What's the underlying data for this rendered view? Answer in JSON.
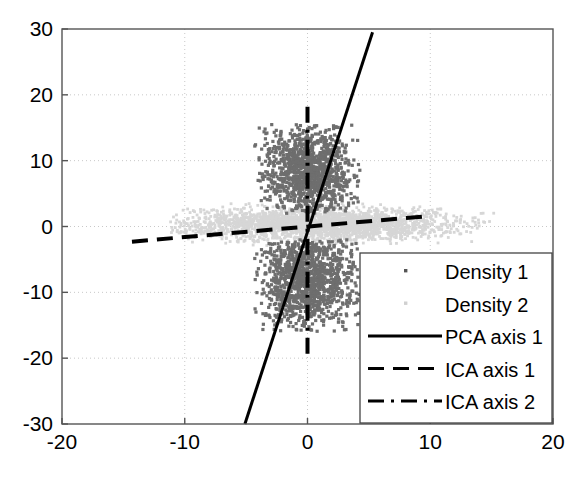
{
  "chart_data": {
    "type": "scatter",
    "title": "",
    "xlabel": "",
    "ylabel": "",
    "xlim": [
      -20,
      20
    ],
    "ylim": [
      -30,
      30
    ],
    "xticks": [
      -20,
      -10,
      0,
      10,
      20
    ],
    "yticks": [
      -30,
      -20,
      -10,
      0,
      10,
      20,
      30
    ],
    "xtick_labels": [
      "-20",
      "-10",
      "0",
      "10",
      "20"
    ],
    "ytick_labels": [
      "-30",
      "-20",
      "-10",
      "0",
      "10",
      "20",
      "30"
    ],
    "grid": true,
    "grid_style": "dotted",
    "grid_color": "#c8c8c8",
    "axes_color": "#555555",
    "background": "#ffffff",
    "legend_position": "lower right",
    "series": [
      {
        "name": "Density 1",
        "type": "scatter",
        "marker": "dot",
        "color": "#6e6e6e",
        "description": "Dense vertically-elongated bimodal point cloud centred at x=0, two lobes above and below y=0",
        "n_points": 2600,
        "x_center": 0,
        "y_center": 0,
        "x_spread": 1.9,
        "y_spread": 6.0,
        "x_range": [
          -4.3,
          4.3
        ],
        "y_range": [
          -16.0,
          15.5
        ],
        "bimodal_gap": [
          -2.0,
          2.0
        ],
        "lobe_centers_y": [
          8.0,
          -8.0
        ]
      },
      {
        "name": "Density 2",
        "type": "scatter",
        "marker": "dot",
        "color": "#d6d6d6",
        "description": "Sparse horizontally-elongated band centred at x=0 y=0.5 extending far left and right",
        "n_points": 2600,
        "x_center": 0.8,
        "y_center": 0.4,
        "x_spread": 5.2,
        "y_spread": 1.2,
        "x_range": [
          -11.5,
          15.5
        ],
        "y_range": [
          -3.0,
          3.5
        ]
      },
      {
        "name": "PCA axis 1",
        "type": "line",
        "style": "solid",
        "color": "#000000",
        "width": 3,
        "points": [
          [
            -5.1,
            -30.0
          ],
          [
            5.3,
            29.5
          ]
        ],
        "slope": 5.72,
        "intercept": 0.0
      },
      {
        "name": "ICA axis 1",
        "type": "line",
        "style": "dashed",
        "color": "#000000",
        "width": 4,
        "points": [
          [
            -14.3,
            -2.3
          ],
          [
            10.0,
            1.6
          ]
        ],
        "slope": 0.16,
        "intercept": 0.0
      },
      {
        "name": "ICA axis 2",
        "type": "line",
        "style": "dashdot",
        "color": "#000000",
        "width": 4,
        "points": [
          [
            0.0,
            18.2
          ],
          [
            0.0,
            -20.0
          ]
        ],
        "slope": null,
        "intercept": 0.0
      }
    ],
    "legend_entries": [
      {
        "label": "Density 1",
        "kind": "marker",
        "style": "dot",
        "color": "#555555"
      },
      {
        "label": "Density 2",
        "kind": "marker",
        "style": "dot",
        "color": "#d0d0d0"
      },
      {
        "label": "PCA axis 1",
        "kind": "line",
        "style": "solid",
        "color": "#000000"
      },
      {
        "label": "ICA axis 1",
        "kind": "line",
        "style": "dashed",
        "color": "#000000"
      },
      {
        "label": "ICA axis 2",
        "kind": "line",
        "style": "dashdot",
        "color": "#000000"
      }
    ]
  }
}
